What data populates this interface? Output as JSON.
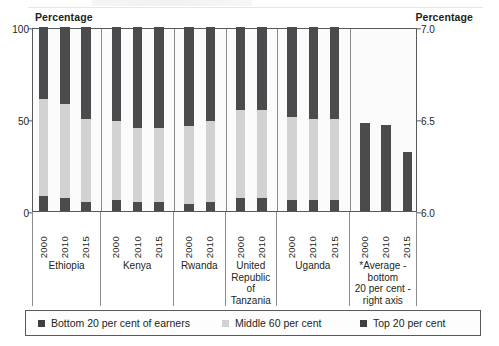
{
  "axis_captions": {
    "left": "Percentage",
    "right": "Percentage"
  },
  "legend": {
    "items": [
      {
        "label": "Bottom 20 per cent of earners",
        "swatch": "dark",
        "color": "#3f3f41"
      },
      {
        "label": "Middle 60 per cent",
        "swatch": "light",
        "color": "#d2d2d2"
      },
      {
        "label": "Top 20 per cent",
        "swatch": "dark",
        "color": "#3f3f41"
      }
    ]
  },
  "chart_data": {
    "type": "bar",
    "subtype": "stacked-bar-with-secondary-axis",
    "title": "",
    "xlabel": "",
    "ylabel": "Percentage",
    "y2label": "Percentage",
    "ylim": [
      0,
      100
    ],
    "yticks": [
      0,
      50,
      100
    ],
    "ytick_labels": [
      "0",
      "50",
      "100"
    ],
    "y2lim": [
      6.0,
      7.0
    ],
    "y2ticks": [
      6.0,
      6.5,
      7.0
    ],
    "y2tick_labels": [
      "6.0",
      "6.5",
      "7.0"
    ],
    "grid": false,
    "legend_position": "bottom",
    "stack_order": [
      "Bottom 20 per cent of earners",
      "Middle 60 per cent",
      "Top 20 per cent"
    ],
    "colors": {
      "bottom_20": "#4b4b4d",
      "middle_60": "#d2d2d2",
      "top_20": "#4b4b4d",
      "average_bar": "#4b4b4d",
      "frame": "#58595b",
      "plot_background": "#fbfbfb"
    },
    "groups": [
      {
        "name": "Ethiopia",
        "name_lines": [
          "Ethiopia"
        ],
        "axis": "left",
        "bars": [
          {
            "year": "2000",
            "bottom_20": 8,
            "middle_60": 53,
            "top_20": 39
          },
          {
            "year": "2010",
            "bottom_20": 7,
            "middle_60": 51,
            "top_20": 42
          },
          {
            "year": "2015",
            "bottom_20": 5,
            "middle_60": 45,
            "top_20": 50
          }
        ]
      },
      {
        "name": "Kenya",
        "name_lines": [
          "Kenya"
        ],
        "axis": "left",
        "bars": [
          {
            "year": "2000",
            "bottom_20": 6,
            "middle_60": 43,
            "top_20": 51
          },
          {
            "year": "2010",
            "bottom_20": 5,
            "middle_60": 40,
            "top_20": 55
          },
          {
            "year": "2015",
            "bottom_20": 5,
            "middle_60": 40,
            "top_20": 55
          }
        ]
      },
      {
        "name": "Rwanda",
        "name_lines": [
          "Rwanda"
        ],
        "axis": "left",
        "bars": [
          {
            "year": "2000",
            "bottom_20": 4,
            "middle_60": 42,
            "top_20": 54
          },
          {
            "year": "2010",
            "bottom_20": 5,
            "middle_60": 44,
            "top_20": 51
          }
        ]
      },
      {
        "name": "United Republic of Tanzania",
        "name_lines": [
          "United",
          "Republic",
          "of Tanzania"
        ],
        "axis": "left",
        "bars": [
          {
            "year": "2000",
            "bottom_20": 7,
            "middle_60": 48,
            "top_20": 45
          },
          {
            "year": "2010",
            "bottom_20": 7,
            "middle_60": 48,
            "top_20": 45
          }
        ]
      },
      {
        "name": "Uganda",
        "name_lines": [
          "Uganda"
        ],
        "axis": "left",
        "bars": [
          {
            "year": "2000",
            "bottom_20": 6,
            "middle_60": 45,
            "top_20": 49
          },
          {
            "year": "2010",
            "bottom_20": 6,
            "middle_60": 44,
            "top_20": 50
          },
          {
            "year": "2015",
            "bottom_20": 6,
            "middle_60": 44,
            "top_20": 50
          }
        ]
      },
      {
        "name": "*Average - bottom 20 per cent - right axis",
        "name_lines": [
          "*Average -",
          "bottom",
          "20 per cent -",
          "right axis"
        ],
        "axis": "right",
        "bars": [
          {
            "year": "2000",
            "value": 6.48
          },
          {
            "year": "2010",
            "value": 6.47
          },
          {
            "year": "2015",
            "value": 6.32
          }
        ]
      }
    ]
  }
}
